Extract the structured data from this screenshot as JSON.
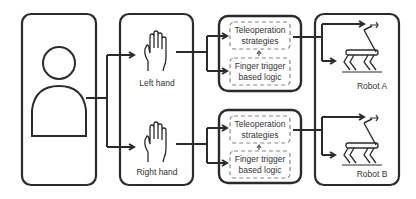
{
  "diagram": {
    "operator": {
      "label": ""
    },
    "hands": [
      {
        "label": "Left hand"
      },
      {
        "label": "Right hand"
      }
    ],
    "modules": [
      {
        "line1": "Teleoperation",
        "line2": "strategies",
        "line3": "Finger trigger",
        "line4": "based logic"
      },
      {
        "line1": "Teleoperation",
        "line2": "strategies",
        "line3": "Finger trigger",
        "line4": "based logic"
      }
    ],
    "robots": [
      {
        "label": "Robot A"
      },
      {
        "label": "Robot B"
      }
    ],
    "colors": {
      "stroke": "#2b2b2b",
      "dashed": "#888888",
      "text": "#333333"
    }
  }
}
